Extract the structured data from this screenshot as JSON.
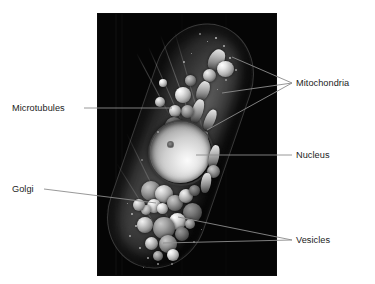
{
  "figure": {
    "type": "labeled-micrograph",
    "panel": {
      "background_color": "#050505",
      "x": 97,
      "y": 13,
      "width": 180,
      "height": 263
    },
    "text_color": "#1b1b1b",
    "leader_color": "#8c8c8c"
  },
  "labels": [
    {
      "id": "mitochondria",
      "text": "Mitochondria",
      "side": "right",
      "x": 296,
      "y": 79,
      "leader_count": 3
    },
    {
      "id": "microtubules",
      "text": "Microtubules",
      "side": "left",
      "x": 12,
      "y": 104,
      "leader_count": 1
    },
    {
      "id": "nucleus",
      "text": "Nucleus",
      "side": "right",
      "x": 296,
      "y": 150,
      "leader_count": 1
    },
    {
      "id": "golgi",
      "text": "Golgi",
      "side": "left",
      "x": 12,
      "y": 186,
      "leader_count": 1
    },
    {
      "id": "vesicles",
      "text": "Vesicles",
      "side": "right",
      "x": 296,
      "y": 236,
      "leader_count": 2
    }
  ],
  "organelles": {
    "nucleus": {
      "label": "Nucleus",
      "cx": 185,
      "cy": 152,
      "r": 31
    },
    "mitochondria_targets": [
      {
        "x": 232,
        "y": 57
      },
      {
        "x": 222,
        "y": 93
      },
      {
        "x": 210,
        "y": 128
      }
    ],
    "microtubule_target": {
      "x": 172,
      "y": 108
    },
    "golgi_target": {
      "x": 155,
      "y": 203
    },
    "vesicle_targets": [
      {
        "x": 178,
        "y": 218
      },
      {
        "x": 165,
        "y": 243
      }
    ]
  }
}
